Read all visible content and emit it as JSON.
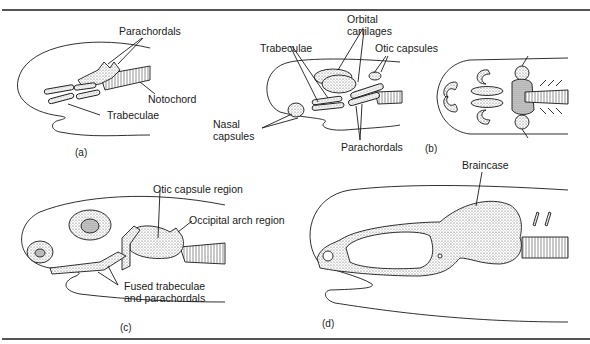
{
  "figure": {
    "panels": [
      {
        "id": "a",
        "caption": "(a)",
        "labels": {
          "parachordals": "Parachordals",
          "notochord": "Notochord",
          "trabeculae": "Trabeculae"
        }
      },
      {
        "id": "b",
        "caption": "(b)",
        "labels": {
          "orbital_cartilages_1": "Orbital",
          "orbital_cartilages_2": "cartilages",
          "trabeculae": "Trabeculae",
          "otic_capsules": "Otic capsules",
          "nasal_capsules_1": "Nasal",
          "nasal_capsules_2": "capsules",
          "parachordals": "Parachordals"
        }
      },
      {
        "id": "c",
        "caption": "(c)",
        "labels": {
          "otic_capsule_region": "Otic capsule region",
          "occipital_arch_region": "Occipital arch region",
          "fused_1": "Fused trabeculae",
          "fused_2": "and parachordals"
        }
      },
      {
        "id": "d",
        "caption": "(d)",
        "labels": {
          "braincase": "Braincase"
        }
      }
    ],
    "colors": {
      "ink": "#1a1a1a",
      "stipple": "#bdbdbd",
      "rule": "#555555"
    }
  }
}
